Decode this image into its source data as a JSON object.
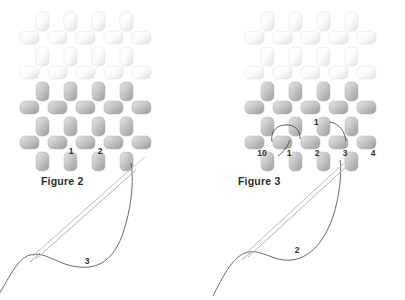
{
  "canvas": {
    "width": 405,
    "height": 300,
    "background": "#ffffff"
  },
  "palette": {
    "bead_light_fill": "#fbfbfb",
    "bead_light_shade": "#e3e3e3",
    "bead_light_stroke": "#dcdcdc",
    "bead_dark_fill": "#cfcfcf",
    "bead_dark_shade": "#9a9a9a",
    "bead_dark_stroke": "#b0b0b0",
    "thread": "#5a5a5a",
    "needle": "#b9b9b9",
    "label_text": "#2f2f2f",
    "caption_text": "#2b2b2b"
  },
  "figures": [
    {
      "id": "figure-2",
      "caption": "Figure 2",
      "caption_pos": {
        "x": 41,
        "y": 175
      },
      "origin": {
        "x": 8,
        "y": 8
      },
      "bead_labels": [
        {
          "text": "1",
          "x": 71,
          "y": 152
        },
        {
          "text": "2",
          "x": 100,
          "y": 152
        }
      ],
      "thread_labels": [
        {
          "text": "3",
          "x": 87,
          "y": 262
        }
      ]
    },
    {
      "id": "figure-3",
      "caption": "Figure 3",
      "caption_pos": {
        "x": 238,
        "y": 175
      },
      "origin": {
        "x": 233,
        "y": 8
      },
      "bead_labels": [
        {
          "text": "1",
          "x": 316,
          "y": 123
        },
        {
          "text": "10",
          "x": 262,
          "y": 154
        },
        {
          "text": "1",
          "x": 289,
          "y": 154
        },
        {
          "text": "2",
          "x": 317,
          "y": 154
        },
        {
          "text": "3",
          "x": 345,
          "y": 154
        },
        {
          "text": "4",
          "x": 373,
          "y": 154
        }
      ],
      "thread_labels": [
        {
          "text": "2",
          "x": 297,
          "y": 251
        }
      ]
    }
  ],
  "bead_grid": {
    "description": "brick-stitch bead lattice, alternating vertical and horizontal bead rows, pale top half and shaded bottom half",
    "vertical_bead": {
      "w": 13,
      "h": 19,
      "radius": 5
    },
    "horizontal_bead": {
      "w": 19,
      "h": 13,
      "radius": 5
    },
    "col_step": 28,
    "row_step": 16,
    "rows": [
      {
        "type": "vertical",
        "tone": "light",
        "count": 4,
        "x0": 36,
        "y": 12
      },
      {
        "type": "horizontal",
        "tone": "light",
        "count": 5,
        "x0": 20,
        "y": 31
      },
      {
        "type": "vertical",
        "tone": "light",
        "count": 4,
        "x0": 36,
        "y": 47
      },
      {
        "type": "horizontal",
        "tone": "light",
        "count": 5,
        "x0": 20,
        "y": 66
      },
      {
        "type": "vertical",
        "tone": "dark",
        "count": 4,
        "x0": 36,
        "y": 82
      },
      {
        "type": "horizontal",
        "tone": "dark",
        "count": 5,
        "x0": 20,
        "y": 101
      },
      {
        "type": "vertical",
        "tone": "dark",
        "count": 4,
        "x0": 36,
        "y": 117
      },
      {
        "type": "horizontal",
        "tone": "dark",
        "count": 5,
        "x0": 20,
        "y": 136
      },
      {
        "type": "vertical",
        "tone": "dark",
        "count": 4,
        "x0": 36,
        "y": 152
      }
    ]
  },
  "icons": {
    "needle": "sewing-needle-icon",
    "thread": "thread-path-icon",
    "bead": "bead-icon"
  },
  "figure2_paths": {
    "thread_main": "M -2,296 C 10,276 18,258 30,255 C 44,251 54,262 72,266 C 96,271 112,262 122,236 C 132,208 134,180 131,163",
    "needle_body": "M 36,259 L 136,170",
    "needle_body2": "M 33,256 L 133,167",
    "needle_tip": "M 133,167 L 145,157",
    "needle_eye": "M 30,262 L 40,253"
  },
  "figure3_paths": {
    "thread_main": "M 213,296 C 222,278 232,258 245,253 C 258,248 268,258 284,260 C 302,262 320,250 331,222 C 340,198 342,172 340,160",
    "needle_body": "M 248,257 L 346,167",
    "needle_body2": "M 245,254 L 343,164",
    "needle_tip": "M 343,164 L 356,152",
    "needle_eye": "M 242,260 L 252,251",
    "loop_left": "M 272,142 C 270,130 278,124 289,125 C 297,126 300,132 300,139",
    "loop_right": "M 330,122 C 340,124 345,132 346,141",
    "small_hook": "M 290,140 C 287,148 283,152 278,156"
  }
}
